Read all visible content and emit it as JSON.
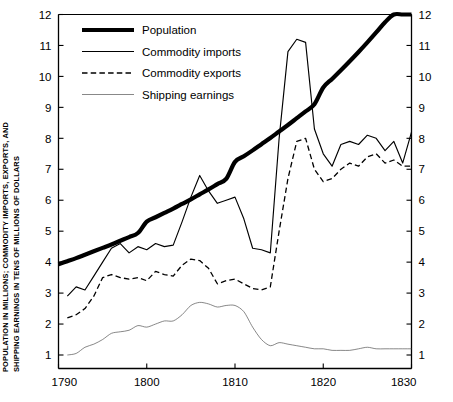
{
  "chart_data": {
    "type": "line",
    "title": "",
    "subtitle": "",
    "xlabel": "",
    "ylabel": "POPULATION IN MILLIONS; COMMODITY IMPORTS, EXPORTS, AND SHIPPING EARNINGS IN TENS OF MILLIONS OF DOLLARS",
    "ylabel_line1": "POPULATION IN MILLIONS; COMMODITY IMPORTS, EXPORTS, AND",
    "ylabel_line2": "SHIPPING EARNINGS IN TENS OF MILLIONS OF DOLLARS",
    "xlim": [
      1790,
      1830
    ],
    "ylim": [
      0,
      12
    ],
    "xticks": [
      1790,
      1800,
      1810,
      1820,
      1830
    ],
    "xtick_labels": [
      "1790",
      "1800",
      "1810",
      "1820",
      "1830"
    ],
    "xticks_minor": [
      1792,
      1794,
      1796,
      1798,
      1802,
      1804,
      1806,
      1808,
      1812,
      1814,
      1816,
      1818,
      1822,
      1824,
      1826,
      1828
    ],
    "yticks": [
      1,
      2,
      3,
      4,
      5,
      6,
      7,
      8,
      9,
      10,
      11,
      12
    ],
    "ytick_labels": [
      "1",
      "2",
      "3",
      "4",
      "5",
      "6",
      "7",
      "8",
      "9",
      "10",
      "11",
      "12"
    ],
    "y_axis_right": true,
    "ytick_labels_right": [
      "1",
      "2",
      "3",
      "4",
      "5",
      "6",
      "7",
      "8",
      "9",
      "10",
      "11",
      "12"
    ],
    "grid": false,
    "legend_position": "top-left",
    "legend": [
      {
        "name": "Population",
        "style": "solid",
        "width": 4.2
      },
      {
        "name": "Commodity imports",
        "style": "solid",
        "width": 1.15
      },
      {
        "name": "Commodity exports",
        "style": "dashed",
        "width": 1.3
      },
      {
        "name": "Shipping earnings",
        "style": "solid",
        "width": 0.7
      }
    ],
    "series": [
      {
        "name": "Population",
        "style": "solid",
        "width": 4.2,
        "color": "#000000",
        "x": [
          1790,
          1791,
          1792,
          1793,
          1794,
          1795,
          1796,
          1797,
          1798,
          1799,
          1800,
          1801,
          1802,
          1803,
          1804,
          1805,
          1806,
          1807,
          1808,
          1809,
          1810,
          1811,
          1812,
          1813,
          1814,
          1815,
          1816,
          1817,
          1818,
          1819,
          1820,
          1821,
          1822,
          1823,
          1824,
          1825,
          1826,
          1827,
          1828,
          1829,
          1830
        ],
        "y": [
          3.93,
          4.03,
          4.13,
          4.24,
          4.35,
          4.46,
          4.57,
          4.69,
          4.81,
          4.94,
          5.31,
          5.45,
          5.59,
          5.73,
          5.88,
          6.03,
          6.19,
          6.35,
          6.52,
          6.69,
          7.24,
          7.42,
          7.61,
          7.81,
          8.01,
          8.22,
          8.43,
          8.65,
          8.87,
          9.1,
          9.64,
          9.92,
          10.2,
          10.49,
          10.79,
          11.1,
          11.42,
          11.75,
          12.0,
          12.0,
          12.0
        ]
      },
      {
        "name": "Commodity imports",
        "style": "solid",
        "width": 1.15,
        "color": "#000000",
        "x": [
          1791,
          1792,
          1793,
          1794,
          1795,
          1796,
          1797,
          1798,
          1799,
          1800,
          1801,
          1802,
          1803,
          1804,
          1805,
          1806,
          1807,
          1808,
          1809,
          1810,
          1811,
          1812,
          1813,
          1814,
          1815,
          1816,
          1817,
          1818,
          1819,
          1820,
          1821,
          1822,
          1823,
          1824,
          1825,
          1826,
          1827,
          1828,
          1829,
          1830
        ],
        "y": [
          2.9,
          3.2,
          3.1,
          3.55,
          4.0,
          4.45,
          4.6,
          4.3,
          4.5,
          4.4,
          4.6,
          4.5,
          4.55,
          5.3,
          6.1,
          6.8,
          6.3,
          5.9,
          6.0,
          6.1,
          5.4,
          4.45,
          4.4,
          4.3,
          8.0,
          10.8,
          11.2,
          11.1,
          8.3,
          7.5,
          7.1,
          7.8,
          7.9,
          7.8,
          8.1,
          8.0,
          7.6,
          7.9,
          7.2,
          8.2
        ]
      },
      {
        "name": "Commodity exports",
        "style": "dashed",
        "width": 1.3,
        "color": "#000000",
        "x": [
          1791,
          1792,
          1793,
          1794,
          1795,
          1796,
          1797,
          1798,
          1799,
          1800,
          1801,
          1802,
          1803,
          1804,
          1805,
          1806,
          1807,
          1808,
          1809,
          1810,
          1811,
          1812,
          1813,
          1814,
          1815,
          1816,
          1817,
          1818,
          1819,
          1820,
          1821,
          1822,
          1823,
          1824,
          1825,
          1826,
          1827,
          1828,
          1829,
          1830
        ],
        "y": [
          2.2,
          2.3,
          2.5,
          2.9,
          3.5,
          3.6,
          3.5,
          3.45,
          3.5,
          3.4,
          3.7,
          3.6,
          3.55,
          3.9,
          4.1,
          4.05,
          3.8,
          3.3,
          3.4,
          3.45,
          3.3,
          3.15,
          3.1,
          3.2,
          5.0,
          6.7,
          7.9,
          8.0,
          7.0,
          6.6,
          6.7,
          7.0,
          7.2,
          7.1,
          7.4,
          7.5,
          7.2,
          7.3,
          7.1,
          7.1
        ]
      },
      {
        "name": "Shipping earnings",
        "style": "solid",
        "width": 0.7,
        "color": "#555555",
        "x": [
          1791,
          1792,
          1793,
          1794,
          1795,
          1796,
          1797,
          1798,
          1799,
          1800,
          1801,
          1802,
          1803,
          1804,
          1805,
          1806,
          1807,
          1808,
          1809,
          1810,
          1811,
          1812,
          1813,
          1814,
          1815,
          1816,
          1817,
          1818,
          1819,
          1820,
          1821,
          1822,
          1823,
          1824,
          1825,
          1826,
          1827,
          1828,
          1829,
          1830
        ],
        "y": [
          1.0,
          1.05,
          1.25,
          1.35,
          1.5,
          1.7,
          1.75,
          1.8,
          1.95,
          1.9,
          2.0,
          2.1,
          2.1,
          2.3,
          2.6,
          2.7,
          2.65,
          2.55,
          2.6,
          2.6,
          2.4,
          1.9,
          1.5,
          1.3,
          1.4,
          1.35,
          1.3,
          1.25,
          1.2,
          1.2,
          1.15,
          1.15,
          1.15,
          1.2,
          1.25,
          1.2,
          1.2,
          1.2,
          1.2,
          1.2
        ]
      }
    ]
  }
}
